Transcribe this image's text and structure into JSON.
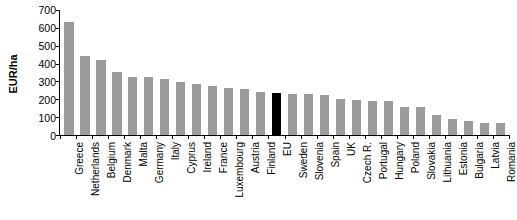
{
  "chart_data": {
    "type": "bar",
    "title": "",
    "subtitle": "",
    "xlabel": "",
    "ylabel": "EUR/ha",
    "ylim": [
      0,
      700
    ],
    "ytick_values": [
      0,
      100,
      200,
      300,
      400,
      500,
      600,
      700
    ],
    "ytick_labels": [
      "0",
      "100",
      "200",
      "300",
      "400",
      "500",
      "600",
      "700"
    ],
    "grid": false,
    "legend": null,
    "bar_color": "#9a9a9a",
    "highlight_color": "#000000",
    "highlight_category": "EU",
    "categories": [
      "Greece",
      "Netherlands",
      "Belgium",
      "Denmark",
      "Malta",
      "Germany",
      "Italy",
      "Cyprus",
      "Ireland",
      "France",
      "Luxembourg",
      "Austria",
      "Finland",
      "EU",
      "Sweden",
      "Slovenia",
      "Spain",
      "UK",
      "Czech R.",
      "Portugal",
      "Hungary",
      "Poland",
      "Slovakia",
      "Lithuania",
      "Estonia",
      "Bulgaria",
      "Latvia",
      "Romania"
    ],
    "values": [
      635,
      440,
      422,
      352,
      323,
      324,
      315,
      299,
      284,
      275,
      264,
      257,
      242,
      235,
      230,
      228,
      225,
      202,
      198,
      192,
      192,
      157,
      157,
      110,
      92,
      76,
      70,
      67
    ]
  }
}
